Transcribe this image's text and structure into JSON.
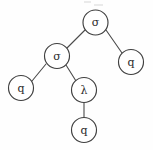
{
  "diagram": {
    "background_color": "#fefefe",
    "stroke_color": "#3f3f3f",
    "text_color": "#2b2b2b",
    "node_radius": 12.5,
    "nodes": [
      {
        "id": "root",
        "label": "σ",
        "cx": 95.5,
        "cy": 22.5
      },
      {
        "id": "left",
        "label": "σ",
        "cx": 57,
        "cy": 56
      },
      {
        "id": "right-leaf",
        "label": "q",
        "cx": 131,
        "cy": 62
      },
      {
        "id": "left-leaf",
        "label": "q",
        "cx": 21,
        "cy": 88
      },
      {
        "id": "lambda",
        "label": "λ",
        "cx": 84,
        "cy": 90
      },
      {
        "id": "bottom-leaf",
        "label": "q",
        "cx": 84,
        "cy": 130
      }
    ],
    "edges": [
      {
        "id": "root-to-left",
        "x1": 85,
        "y1": 30,
        "x2": 67,
        "y2": 48
      },
      {
        "id": "root-to-right-leaf",
        "x1": 106,
        "y1": 30,
        "x2": 122,
        "y2": 53
      },
      {
        "id": "left-to-left-leaf",
        "x1": 46,
        "y1": 64,
        "x2": 32,
        "y2": 81
      },
      {
        "id": "left-to-lambda",
        "x1": 66,
        "y1": 65,
        "x2": 76,
        "y2": 81
      },
      {
        "id": "lambda-to-bottom-leaf",
        "x1": 84,
        "y1": 103,
        "x2": 84,
        "y2": 117
      }
    ],
    "artifacts": [
      {
        "id": "top-smudge-left",
        "x": 84,
        "y": 1,
        "w": 7,
        "h": 2
      },
      {
        "id": "top-smudge-right",
        "x": 94,
        "y": 4,
        "w": 9,
        "h": 2
      }
    ]
  }
}
